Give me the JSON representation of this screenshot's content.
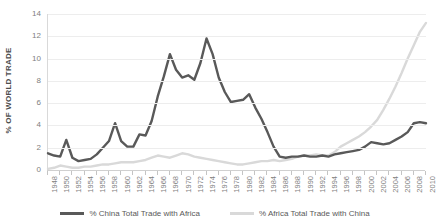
{
  "chart_data": {
    "type": "line",
    "title": "",
    "xlabel": "",
    "ylabel": "% OF WORLD TRADE",
    "ylim": [
      0,
      14
    ],
    "yticks": [
      0,
      2,
      4,
      6,
      8,
      10,
      12,
      14
    ],
    "xlim": [
      1948,
      2010
    ],
    "xticks": [
      1948,
      1950,
      1952,
      1954,
      1956,
      1958,
      1960,
      1962,
      1964,
      1966,
      1968,
      1970,
      1972,
      1974,
      1976,
      1978,
      1980,
      1982,
      1984,
      1986,
      1988,
      1990,
      1992,
      1994,
      1996,
      1998,
      2000,
      2002,
      2004,
      2006,
      2008,
      2010
    ],
    "grid": true,
    "legend_position": "bottom",
    "x": [
      1948,
      1949,
      1950,
      1951,
      1952,
      1953,
      1954,
      1955,
      1956,
      1957,
      1958,
      1959,
      1960,
      1961,
      1962,
      1963,
      1964,
      1965,
      1966,
      1967,
      1968,
      1969,
      1970,
      1971,
      1972,
      1973,
      1974,
      1975,
      1976,
      1977,
      1978,
      1979,
      1980,
      1981,
      1982,
      1983,
      1984,
      1985,
      1986,
      1987,
      1988,
      1989,
      1990,
      1991,
      1992,
      1993,
      1994,
      1995,
      1996,
      1997,
      1998,
      1999,
      2000,
      2001,
      2002,
      2003,
      2004,
      2005,
      2006,
      2007,
      2008,
      2009,
      2010
    ],
    "series": [
      {
        "name": "% China Total Trade with Africa",
        "color": "#595959",
        "values": [
          1.5,
          1.3,
          1.2,
          2.7,
          1.1,
          0.8,
          0.9,
          1.0,
          1.4,
          2.0,
          2.6,
          4.2,
          2.6,
          2.1,
          2.1,
          3.2,
          3.1,
          4.4,
          6.6,
          8.4,
          10.4,
          9.0,
          8.3,
          8.5,
          8.1,
          9.6,
          11.8,
          10.4,
          8.3,
          7.0,
          6.1,
          6.2,
          6.3,
          6.8,
          5.6,
          4.6,
          3.4,
          2.1,
          1.2,
          1.1,
          1.2,
          1.2,
          1.3,
          1.2,
          1.2,
          1.3,
          1.2,
          1.4,
          1.5,
          1.6,
          1.7,
          1.8,
          2.1,
          2.5,
          2.4,
          2.3,
          2.4,
          2.7,
          3.0,
          3.4,
          4.2,
          4.3,
          4.2
        ]
      },
      {
        "name": "% Africa Total Trade with China",
        "color": "#d9d9d9",
        "values": [
          0.1,
          0.2,
          0.4,
          0.3,
          0.2,
          0.2,
          0.3,
          0.3,
          0.4,
          0.5,
          0.5,
          0.6,
          0.7,
          0.7,
          0.7,
          0.8,
          0.9,
          1.1,
          1.3,
          1.2,
          1.1,
          1.3,
          1.5,
          1.4,
          1.2,
          1.1,
          1.0,
          0.9,
          0.8,
          0.7,
          0.6,
          0.5,
          0.5,
          0.6,
          0.7,
          0.8,
          0.8,
          0.9,
          0.8,
          0.9,
          1.0,
          1.2,
          1.3,
          1.3,
          1.4,
          1.3,
          1.3,
          1.6,
          2.1,
          2.4,
          2.7,
          3.0,
          3.4,
          3.9,
          4.5,
          5.4,
          6.4,
          7.5,
          8.7,
          10.0,
          11.2,
          12.4,
          13.2
        ]
      }
    ]
  },
  "legend": {
    "items": [
      {
        "label": "% China Total Trade with Africa",
        "color": "#595959"
      },
      {
        "label": "% Africa Total Trade with China",
        "color": "#d9d9d9"
      }
    ]
  }
}
